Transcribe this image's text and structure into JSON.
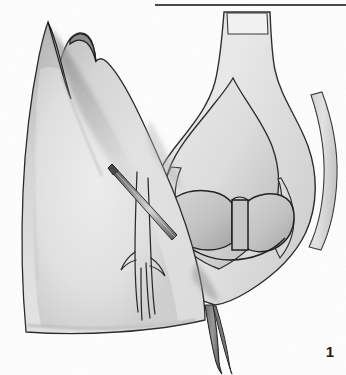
{
  "page": {
    "kind": "scanned-figure",
    "background_color": "#ffffff",
    "width": 346,
    "height": 375
  },
  "top_rule": {
    "present": true,
    "color": "#4a4a4a",
    "x": 155,
    "y": 4,
    "width": 191,
    "thickness": 2
  },
  "figure": {
    "number": "1",
    "caption": "",
    "medium": "graphite pencil drawing"
  },
  "colors": {
    "paper": "#ffffff",
    "tissue_light": "#e4e4e4",
    "tissue_mid": "#c9c9c9",
    "tissue_dark": "#9b9b9b",
    "shadow_deep": "#6d6d6d",
    "ink_line": "#2a2a2a",
    "rule": "#4a4a4a",
    "label_text": "#1c1c1c"
  },
  "structures": [
    {
      "name": "left-tissue-mass",
      "side": "left",
      "label": ""
    },
    {
      "name": "superior-peak",
      "side": "left",
      "label": ""
    },
    {
      "name": "peak-notch",
      "side": "left",
      "label": ""
    },
    {
      "name": "needle-probe",
      "side": "center",
      "label": ""
    },
    {
      "name": "branching-ducts",
      "side": "center",
      "label": ""
    },
    {
      "name": "duct-neck",
      "side": "right",
      "label": ""
    },
    {
      "name": "dilated-chamber",
      "side": "right",
      "label": ""
    },
    {
      "name": "valve-leaflets",
      "side": "right",
      "label": ""
    },
    {
      "name": "central-septum",
      "side": "right",
      "label": ""
    },
    {
      "name": "inferior-tail",
      "side": "right",
      "label": ""
    },
    {
      "name": "cut-wall-edge",
      "side": "right",
      "label": ""
    }
  ]
}
